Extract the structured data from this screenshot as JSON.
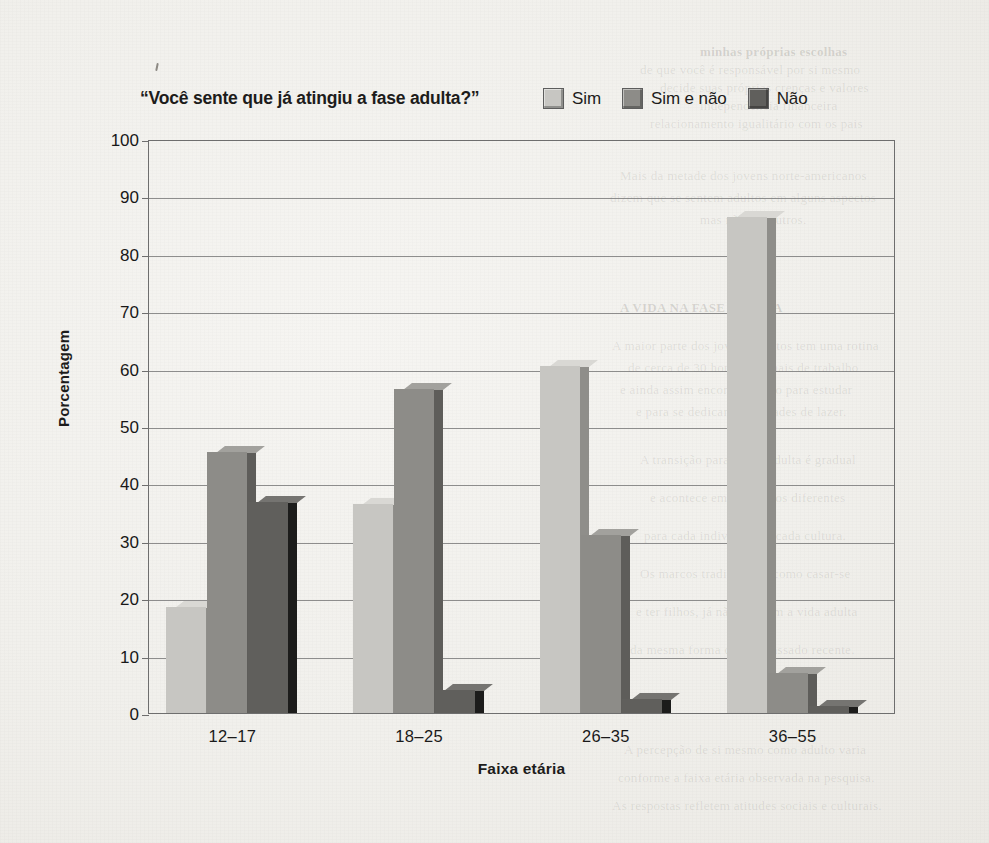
{
  "page": {
    "ghost_text": [
      {
        "t": "minhas próprias escolhas",
        "x": 700,
        "y": 44,
        "b": true
      },
      {
        "t": "de que você é responsável por si mesmo",
        "x": 640,
        "y": 62
      },
      {
        "t": "decide suas próprias crenças e valores",
        "x": 660,
        "y": 80
      },
      {
        "t": "independência financeira",
        "x": 700,
        "y": 98
      },
      {
        "t": "relacionamento igualitário com os pais",
        "x": 650,
        "y": 116
      },
      {
        "t": "Mais da metade dos jovens norte-americanos",
        "x": 620,
        "y": 168,
        "b": false
      },
      {
        "t": "dizem que se sentem adultos em alguns aspectos",
        "x": 610,
        "y": 190
      },
      {
        "t": "mas não em outros.",
        "x": 700,
        "y": 212
      },
      {
        "t": "A VIDA NA FASE ADULTA",
        "x": 620,
        "y": 300,
        "b": true
      },
      {
        "t": "A maior parte dos jovens adultos tem uma rotina",
        "x": 612,
        "y": 338
      },
      {
        "t": "de cerca de 30 horas semanais de trabalho",
        "x": 628,
        "y": 360
      },
      {
        "t": "e ainda assim encontra tempo para estudar",
        "x": 620,
        "y": 382
      },
      {
        "t": "e para se dedicar a atividades de lazer.",
        "x": 636,
        "y": 404
      },
      {
        "t": "A transição para a fase adulta é gradual",
        "x": 640,
        "y": 452
      },
      {
        "t": "e acontece em momentos diferentes",
        "x": 650,
        "y": 490
      },
      {
        "t": "para cada indivíduo em cada cultura.",
        "x": 644,
        "y": 528
      },
      {
        "t": "Os marcos tradicionais, como casar-se",
        "x": 640,
        "y": 566
      },
      {
        "t": "e ter filhos, já não definem a vida adulta",
        "x": 636,
        "y": 604
      },
      {
        "t": "da mesma forma que no passado recente.",
        "x": 630,
        "y": 642
      },
      {
        "t": "A percepção de si mesmo como adulto varia",
        "x": 624,
        "y": 742
      },
      {
        "t": "conforme a faixa etária observada na pesquisa.",
        "x": 618,
        "y": 770
      },
      {
        "t": "As respostas refletem atitudes sociais e culturais.",
        "x": 612,
        "y": 798
      }
    ]
  },
  "chart_data": {
    "type": "bar",
    "title": "“Você sente que já atingiu a fase adulta?”",
    "xlabel": "Faixa etária",
    "ylabel": "Porcentagem",
    "ylim": [
      0,
      100
    ],
    "yticks": [
      0,
      10,
      20,
      30,
      40,
      50,
      60,
      70,
      80,
      90,
      100
    ],
    "grid": true,
    "legend_position": "top-right",
    "categories": [
      "12–17",
      "18–25",
      "26–35",
      "36–55"
    ],
    "series": [
      {
        "name": "Sim",
        "color": "#c7c6c2",
        "side_color": "#8f8e8a",
        "top_color": "#d9d8d4",
        "values": [
          18.5,
          36.5,
          60.5,
          86.5
        ]
      },
      {
        "name": "Sim e não",
        "color": "#8d8c88",
        "side_color": "#5e5d5a",
        "top_color": "#a2a19d",
        "values": [
          45.5,
          56.5,
          31.0,
          7.0
        ]
      },
      {
        "name": "Não",
        "color": "#605f5c",
        "side_color": "#1c1c1b",
        "top_color": "#757471",
        "values": [
          36.8,
          4.0,
          2.5,
          1.2
        ]
      }
    ]
  }
}
